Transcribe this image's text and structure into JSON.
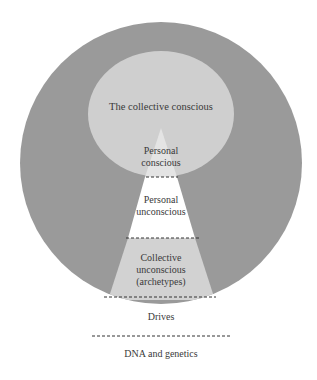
{
  "diagram": {
    "colors": {
      "outer": "#9a9a9a",
      "inner": "#cfcfcf",
      "triangle_light": "#d4d4d4",
      "white": "#ffffff"
    },
    "labels": {
      "collective_conscious": "The collective conscious",
      "personal_conscious_1": "Personal",
      "personal_conscious_2": "conscious",
      "personal_unconscious_1": "Personal",
      "personal_unconscious_2": "unconscious",
      "collective_unconscious_1": "Collective",
      "collective_unconscious_2": "unconscious",
      "collective_unconscious_3": "(archetypes)",
      "drives": "Drives",
      "dna": "DNA and genetics"
    }
  }
}
